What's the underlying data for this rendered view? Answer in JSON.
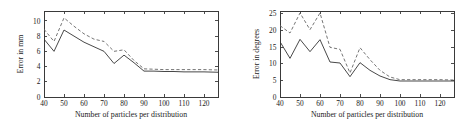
{
  "figure": {
    "panel_count": 2,
    "background": "#ffffff",
    "line_color_solid": "#333333",
    "line_color_dashed": "#6e6e6e"
  },
  "chart_data": [
    {
      "type": "line",
      "title": "",
      "xlabel": "Number of particles per distribution",
      "ylabel": "Error in mm",
      "xlim": [
        40,
        127
      ],
      "ylim": [
        0,
        11.3
      ],
      "xticks": [
        40,
        50,
        60,
        70,
        80,
        90,
        100,
        110,
        120
      ],
      "xticklabels": [
        "40",
        "50",
        "60",
        "70",
        "80",
        "90",
        "100",
        "110",
        "120"
      ],
      "yticks": [
        0,
        2,
        4,
        6,
        8,
        10
      ],
      "yticklabels": [
        "0",
        "2",
        "4",
        "6",
        "8",
        "10"
      ],
      "grid": false,
      "legend": "none",
      "x": [
        40,
        45,
        50,
        55,
        60,
        65,
        70,
        75,
        80,
        85,
        90,
        95,
        100,
        105,
        110,
        115,
        120,
        127
      ],
      "series": [
        {
          "name": "solid",
          "style": "solid",
          "values": [
            7.6,
            6.0,
            8.8,
            8.0,
            7.2,
            6.6,
            6.0,
            4.4,
            5.5,
            4.5,
            3.4,
            3.4,
            3.35,
            3.35,
            3.3,
            3.3,
            3.3,
            3.25
          ]
        },
        {
          "name": "dashed",
          "style": "dashed",
          "values": [
            8.9,
            7.3,
            10.4,
            9.3,
            8.3,
            7.6,
            7.3,
            6.0,
            6.2,
            4.8,
            3.7,
            3.65,
            3.6,
            3.6,
            3.6,
            3.6,
            3.6,
            3.55
          ]
        }
      ]
    },
    {
      "type": "line",
      "title": "",
      "xlabel": "Number of particles per distribution",
      "ylabel": "Error in degrees",
      "xlim": [
        40,
        127
      ],
      "ylim": [
        0,
        25.8
      ],
      "xticks": [
        40,
        50,
        60,
        70,
        80,
        90,
        100,
        110,
        120
      ],
      "xticklabels": [
        "40",
        "50",
        "60",
        "70",
        "80",
        "90",
        "100",
        "110",
        "120"
      ],
      "yticks": [
        0,
        5,
        10,
        15,
        20,
        25
      ],
      "yticklabels": [
        "0",
        "5",
        "10",
        "15",
        "20",
        "25"
      ],
      "grid": false,
      "legend": "none",
      "x": [
        40,
        45,
        50,
        55,
        60,
        65,
        70,
        75,
        80,
        85,
        90,
        95,
        100,
        105,
        110,
        115,
        120,
        127
      ],
      "series": [
        {
          "name": "solid",
          "style": "solid",
          "values": [
            16.6,
            11.6,
            17.3,
            13.6,
            17.2,
            10.5,
            10.2,
            6.1,
            10.3,
            8.0,
            6.3,
            5.2,
            4.8,
            4.8,
            4.8,
            4.8,
            4.8,
            4.8
          ]
        },
        {
          "name": "dashed",
          "style": "dashed",
          "values": [
            21.4,
            19.2,
            25.2,
            20.2,
            25.2,
            14.9,
            14.3,
            7.2,
            14.8,
            11.2,
            8.0,
            6.0,
            5.2,
            5.2,
            5.2,
            5.2,
            5.2,
            5.1
          ]
        }
      ]
    }
  ]
}
